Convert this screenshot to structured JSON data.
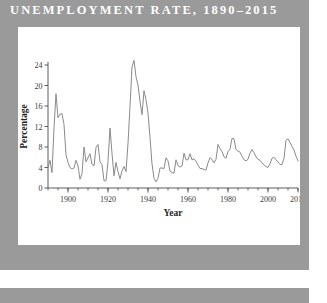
{
  "page": {
    "title": "UNEMPLOYMENT RATE, 1890–2015",
    "background_color": "#9a9a9a",
    "card_color": "#ffffff"
  },
  "chart_data": {
    "type": "line",
    "title": "UNEMPLOYMENT RATE, 1890–2015",
    "xlabel": "Year",
    "ylabel": "Percentage",
    "xlim": [
      1890,
      2015
    ],
    "ylim": [
      0,
      24
    ],
    "yticks": [
      0,
      4,
      8,
      12,
      16,
      20,
      24
    ],
    "ytick_labels": [
      "0",
      "4",
      "8",
      "12",
      "16",
      "20",
      "24"
    ],
    "xticks": [
      1900,
      1920,
      1940,
      1960,
      1980,
      2000,
      2015
    ],
    "xtick_labels": [
      "1900",
      "1920",
      "1940",
      "1960",
      "1980",
      "2000",
      "2015"
    ],
    "minor_xtick_interval": 5,
    "grid": false,
    "legend": null,
    "line_color": "#8a8a8a",
    "line_width": 1,
    "x": [
      1890,
      1891,
      1892,
      1893,
      1894,
      1895,
      1896,
      1897,
      1898,
      1899,
      1900,
      1901,
      1902,
      1903,
      1904,
      1905,
      1906,
      1907,
      1908,
      1909,
      1910,
      1911,
      1912,
      1913,
      1914,
      1915,
      1916,
      1917,
      1918,
      1919,
      1920,
      1921,
      1922,
      1923,
      1924,
      1925,
      1926,
      1927,
      1928,
      1929,
      1930,
      1931,
      1932,
      1933,
      1934,
      1935,
      1936,
      1937,
      1938,
      1939,
      1940,
      1941,
      1942,
      1943,
      1944,
      1945,
      1946,
      1947,
      1948,
      1949,
      1950,
      1951,
      1952,
      1953,
      1954,
      1955,
      1956,
      1957,
      1958,
      1959,
      1960,
      1961,
      1962,
      1963,
      1964,
      1965,
      1966,
      1967,
      1968,
      1969,
      1970,
      1971,
      1972,
      1973,
      1974,
      1975,
      1976,
      1977,
      1978,
      1979,
      1980,
      1981,
      1982,
      1983,
      1984,
      1985,
      1986,
      1987,
      1988,
      1989,
      1990,
      1991,
      1992,
      1993,
      1994,
      1995,
      1996,
      1997,
      1998,
      1999,
      2000,
      2001,
      2002,
      2003,
      2004,
      2005,
      2006,
      2007,
      2008,
      2009,
      2010,
      2011,
      2012,
      2013,
      2014,
      2015
    ],
    "values": [
      4.0,
      5.4,
      3.0,
      11.7,
      18.4,
      13.7,
      14.4,
      14.5,
      12.4,
      6.5,
      5.0,
      4.0,
      3.7,
      3.9,
      5.4,
      4.3,
      1.7,
      2.8,
      8.0,
      5.1,
      5.9,
      6.7,
      4.6,
      4.3,
      7.9,
      8.5,
      5.1,
      4.6,
      1.4,
      1.4,
      5.2,
      11.7,
      6.7,
      2.4,
      5.0,
      3.2,
      1.8,
      3.3,
      4.2,
      3.2,
      8.7,
      15.9,
      23.6,
      24.9,
      21.7,
      20.1,
      16.9,
      14.3,
      19.0,
      17.2,
      14.6,
      9.9,
      4.7,
      1.9,
      1.2,
      1.9,
      3.9,
      3.9,
      3.8,
      5.9,
      5.3,
      3.3,
      3.0,
      2.9,
      5.5,
      4.4,
      4.1,
      4.3,
      6.8,
      5.5,
      5.5,
      6.7,
      5.5,
      5.7,
      5.2,
      4.5,
      3.8,
      3.8,
      3.6,
      3.5,
      4.9,
      5.9,
      5.6,
      4.9,
      5.6,
      8.5,
      7.7,
      7.1,
      6.1,
      5.8,
      7.1,
      7.6,
      9.7,
      9.6,
      7.5,
      7.2,
      7.0,
      6.2,
      5.5,
      5.3,
      5.6,
      6.8,
      7.5,
      6.9,
      6.1,
      5.6,
      5.4,
      4.9,
      4.5,
      4.2,
      4.0,
      4.7,
      5.8,
      6.0,
      5.5,
      5.1,
      4.6,
      4.6,
      5.8,
      9.3,
      9.6,
      8.9,
      8.1,
      7.4,
      6.2,
      5.3
    ]
  }
}
